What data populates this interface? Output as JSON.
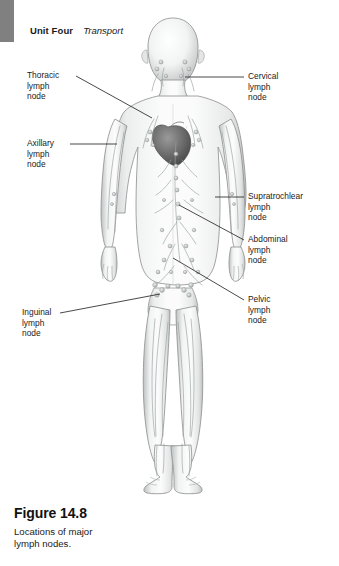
{
  "running_head": {
    "unit": "Unit Four",
    "section": "Transport"
  },
  "figure": {
    "number": "Figure 14.8",
    "caption": "Locations of major\nlymph nodes."
  },
  "labels": {
    "thoracic": {
      "text": "Thoracic\nlymph\nnode"
    },
    "axillary": {
      "text": "Axillary\nlymph\nnode"
    },
    "inguinal": {
      "text": "Inguinal\nlymph\nnode"
    },
    "cervical": {
      "text": "Cervical\nlymph\nnode"
    },
    "supratrochlear": {
      "text": "Supratrochlear\nlymph\nnode"
    },
    "abdominal": {
      "text": "Abdominal\nlymph\nnode"
    },
    "pelvic": {
      "text": "Pelvic\nlymph\nnode"
    }
  },
  "colors": {
    "tab": "#808080",
    "text": "#1b1b1b",
    "leader": "#1a1a1a",
    "body_fill": "#f4f4f4",
    "body_outline": "#8d8d8d",
    "vessel": "#9aa3a3",
    "node": "#b9bfbf",
    "heart": "#6e6e6e"
  },
  "artwork": {
    "subject": "anterior view of human body showing lymphatic system",
    "node_regions": [
      "cervical",
      "axillary",
      "thoracic",
      "supratrochlear",
      "abdominal",
      "pelvic",
      "inguinal"
    ]
  }
}
